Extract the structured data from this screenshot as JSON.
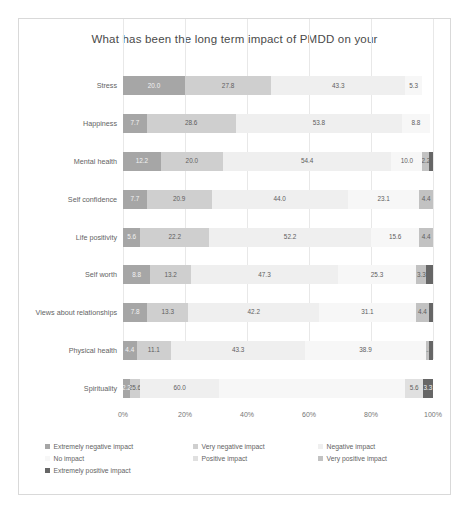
{
  "chart_data": {
    "type": "bar",
    "subtype": "100% stacked horizontal bar",
    "title": "What has been the long term impact of PMDD on your",
    "xlabel": "",
    "ylabel": "",
    "xlim": [
      0,
      100
    ],
    "xticks": [
      "0%",
      "20%",
      "40%",
      "60%",
      "80%",
      "100%"
    ],
    "xtick_values": [
      0,
      20,
      40,
      60,
      80,
      100
    ],
    "grid": true,
    "legend_position": "bottom",
    "categories": [
      "Stress",
      "Happiness",
      "Mental health",
      "Self confidence",
      "Life positivity",
      "Self worth",
      "Views about relationships",
      "Physical health",
      "Spirituality"
    ],
    "series": [
      {
        "name": "Extremely negative impact",
        "color": "#a6a6a6",
        "values": [
          20.0,
          7.7,
          12.2,
          7.7,
          5.6,
          8.8,
          7.8,
          4.4,
          2.2
        ]
      },
      {
        "name": "Very negative impact",
        "color": "#cfcfcf",
        "values": [
          27.8,
          28.6,
          20.0,
          20.9,
          22.2,
          13.2,
          13.3,
          11.1,
          3.3
        ]
      },
      {
        "name": "Negative impact",
        "color": "#efefef",
        "values": [
          43.3,
          53.8,
          54.4,
          44.0,
          52.2,
          47.3,
          42.2,
          43.3,
          25.6
        ]
      },
      {
        "name": "No impact",
        "color": "#f7f7f7",
        "values": [
          5.3,
          8.8,
          10.0,
          23.1,
          15.6,
          25.3,
          31.1,
          38.9,
          60.0
        ]
      },
      {
        "name": "Positive impact",
        "color": "#e0e0e0",
        "values": [
          0.0,
          0.0,
          0.0,
          0.0,
          0.0,
          0.0,
          0.0,
          0.0,
          5.6
        ]
      },
      {
        "name": "Very positive impact",
        "color": "#c2c2c2",
        "values": [
          0.0,
          0.0,
          2.2,
          4.4,
          4.4,
          3.3,
          4.4,
          1.1,
          0.0
        ]
      },
      {
        "name": "Extremely positive impact",
        "color": "#666666",
        "values": [
          0.0,
          0.0,
          1.2,
          0.0,
          0.0,
          2.1,
          1.2,
          1.2,
          3.3
        ]
      }
    ],
    "bar_labels": [
      [
        "20.0",
        "27.8",
        "43.3",
        "5.3",
        "",
        "",
        ""
      ],
      [
        "7.7",
        "28.6",
        "53.8",
        "8.8",
        "",
        "",
        ""
      ],
      [
        "12.2",
        "20.0",
        "54.4",
        "10.0",
        "",
        "2.2",
        ""
      ],
      [
        "7.7",
        "20.9",
        "44.0",
        "23.1",
        "",
        "4.4",
        ""
      ],
      [
        "5.6",
        "22.2",
        "52.2",
        "15.6",
        "",
        "4.4",
        ""
      ],
      [
        "8.8",
        "13.2",
        "47.3",
        "25.3",
        "",
        "3.3",
        ""
      ],
      [
        "7.8",
        "13.3",
        "42.2",
        "31.1",
        "",
        "4.4",
        ""
      ],
      [
        "4.4",
        "11.1",
        "43.3",
        "38.9",
        "",
        "1.1",
        ""
      ],
      [
        "2.2",
        "25.6",
        "60.0",
        "",
        "5.6",
        "",
        "3.3"
      ]
    ]
  }
}
